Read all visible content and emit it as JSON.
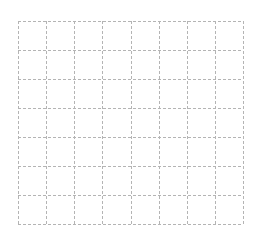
{
  "canvas": {
    "width": 261,
    "height": 244,
    "background": "#ffffff"
  },
  "grid": {
    "columns": 8,
    "rows": 7,
    "left": 18,
    "top": 21,
    "right": 243,
    "bottom": 224,
    "line_color": "#b4b4b4",
    "dash": "3,2",
    "line_width": 1
  }
}
